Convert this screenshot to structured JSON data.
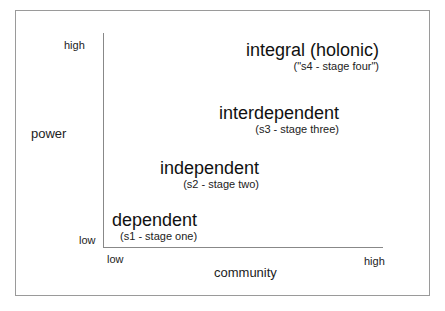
{
  "diagram": {
    "y_axis": {
      "title": "power",
      "low": "low",
      "high": "high"
    },
    "x_axis": {
      "title": "community",
      "low": "low",
      "high": "high"
    },
    "stages": [
      {
        "name": "dependent",
        "sub": "(s1 - stage one)"
      },
      {
        "name": "independent",
        "sub": "(s2 - stage two)"
      },
      {
        "name": "interdependent",
        "sub": "(s3 - stage three)"
      },
      {
        "name": "integral (holonic)",
        "sub": "(\"s4 - stage four\")"
      }
    ]
  },
  "colors": {
    "axis": "#888888",
    "frame": "#9a9a9a",
    "text": "#111111"
  }
}
